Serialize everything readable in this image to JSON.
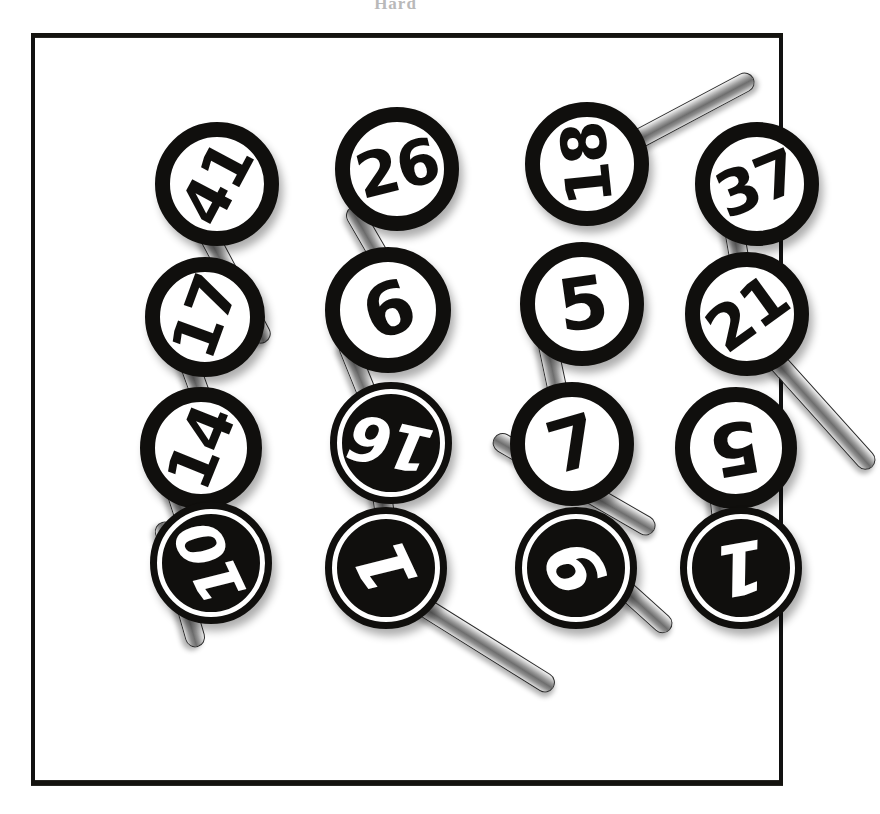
{
  "caption": "Hard",
  "frame": {
    "border_color": "#111111",
    "background": "#ffffff"
  },
  "palette": {
    "ink": "#100f0d",
    "paper": "#ffffff",
    "stick_highlight": "#f4f4f4",
    "stick_shadow": "#6e6e6e"
  },
  "scene": {
    "title": "numbered lollipop paddles",
    "columns": 4,
    "rows": 4,
    "paddles": [
      {
        "label": "41",
        "style": "light",
        "rotation": -62,
        "x": 120,
        "y": 85,
        "size": 124,
        "stick": {
          "angle": 62,
          "length": 150,
          "offx": 40,
          "offy": 78
        }
      },
      {
        "label": "17",
        "style": "light",
        "rotation": -70,
        "x": 110,
        "y": 220,
        "size": 120,
        "stick": {
          "angle": 70,
          "length": 120,
          "offx": 36,
          "offy": 74
        }
      },
      {
        "label": "14",
        "style": "light",
        "rotation": -68,
        "x": 105,
        "y": 350,
        "size": 122,
        "stick": {
          "angle": 72,
          "length": 150,
          "offx": 30,
          "offy": 76
        }
      },
      {
        "label": "10",
        "style": "dark",
        "rotation": -115,
        "x": 115,
        "y": 465,
        "size": 122,
        "stick": {
          "angle": 74,
          "length": 130,
          "offx": 12,
          "offy": 10
        }
      },
      {
        "label": "26",
        "style": "light",
        "rotation": -14,
        "x": 300,
        "y": 70,
        "size": 124,
        "stick": {
          "angle": 60,
          "length": 160,
          "offx": 16,
          "offy": 90
        }
      },
      {
        "label": "6",
        "style": "light",
        "rotation": -20,
        "x": 290,
        "y": 210,
        "size": 126,
        "stick": {
          "angle": 68,
          "length": 150,
          "offx": 20,
          "offy": 82
        }
      },
      {
        "label": "16",
        "style": "dark",
        "rotation": -168,
        "x": 295,
        "y": 345,
        "size": 122,
        "stick": {
          "angle": 82,
          "length": 110,
          "offx": 48,
          "offy": 74
        }
      },
      {
        "label": "1",
        "style": "dark",
        "rotation": -115,
        "x": 290,
        "y": 470,
        "size": 122,
        "stick": {
          "angle": 32,
          "length": 175,
          "offx": 80,
          "offy": 78
        }
      },
      {
        "label": "18",
        "style": "light",
        "rotation": -96,
        "x": 490,
        "y": 65,
        "size": 124,
        "stick": {
          "angle": -28,
          "length": 175,
          "offx": 74,
          "offy": 48
        }
      },
      {
        "label": "5",
        "style": "light",
        "rotation": -8,
        "x": 485,
        "y": 205,
        "size": 124,
        "stick": {
          "angle": 78,
          "length": 140,
          "offx": 26,
          "offy": 84
        }
      },
      {
        "label": "7",
        "style": "light",
        "rotation": -16,
        "x": 475,
        "y": 345,
        "size": 124,
        "stick": {
          "angle": 30,
          "length": 185,
          "offx": -16,
          "offy": 46
        }
      },
      {
        "label": "9",
        "style": "dark",
        "rotation": -118,
        "x": 480,
        "y": 470,
        "size": 122,
        "stick": {
          "angle": 42,
          "length": 160,
          "offx": 36,
          "offy": 6
        }
      },
      {
        "label": "37",
        "style": "light",
        "rotation": -22,
        "x": 660,
        "y": 85,
        "size": 124,
        "stick": {
          "angle": 80,
          "length": 120,
          "offx": 36,
          "offy": 80
        }
      },
      {
        "label": "21",
        "style": "light",
        "rotation": -36,
        "x": 650,
        "y": 215,
        "size": 124,
        "stick": {
          "angle": 48,
          "length": 190,
          "offx": 60,
          "offy": 64
        }
      },
      {
        "label": "5",
        "style": "light",
        "rotation": -190,
        "x": 640,
        "y": 350,
        "size": 122,
        "stick": {
          "angle": 84,
          "length": 120,
          "offx": 42,
          "offy": 76
        }
      },
      {
        "label": "1",
        "style": "dark",
        "rotation": -190,
        "x": 645,
        "y": 470,
        "size": 122,
        "stick": {
          "angle": 90,
          "length": 60,
          "offx": 48,
          "offy": -4
        }
      }
    ]
  }
}
